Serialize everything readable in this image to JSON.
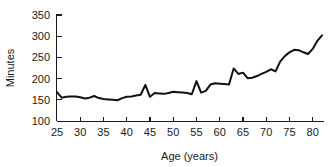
{
  "chart_data": {
    "type": "line",
    "title": "",
    "xlabel": "Age (years)",
    "ylabel": "Minutes",
    "xlim": [
      25,
      82
    ],
    "ylim": [
      100,
      350
    ],
    "grid": false,
    "legend": null,
    "xticks": [
      25,
      30,
      35,
      40,
      45,
      50,
      55,
      60,
      65,
      70,
      75,
      80
    ],
    "yticks": [
      100,
      150,
      200,
      250,
      300,
      350
    ],
    "xtick_labels": [
      "25",
      "30",
      "35",
      "40",
      "45",
      "50",
      "55",
      "60",
      "65",
      "70",
      "75",
      "80"
    ],
    "ytick_labels": [
      "100",
      "150",
      "200",
      "250",
      "300",
      "350"
    ],
    "line_color": "#111111",
    "axis_color": "#1a1a1a",
    "series": [
      {
        "name": "Minutes",
        "x": [
          25,
          26,
          27,
          28,
          29,
          30,
          31,
          32,
          33,
          34,
          35,
          36,
          37,
          38,
          39,
          40,
          41,
          42,
          43,
          44,
          45,
          46,
          47,
          48,
          49,
          50,
          51,
          52,
          53,
          54,
          55,
          56,
          57,
          58,
          59,
          60,
          61,
          62,
          63,
          64,
          65,
          66,
          67,
          68,
          69,
          70,
          71,
          72,
          73,
          74,
          75,
          76,
          77,
          78,
          79,
          80,
          81,
          82
        ],
        "values": [
          168,
          155,
          157,
          158,
          158,
          156,
          153,
          155,
          159,
          154,
          152,
          151,
          150,
          149,
          154,
          157,
          158,
          160,
          162,
          185,
          157,
          166,
          165,
          164,
          166,
          169,
          168,
          167,
          166,
          163,
          194,
          167,
          171,
          186,
          189,
          188,
          187,
          186,
          224,
          211,
          214,
          201,
          202,
          206,
          211,
          216,
          222,
          217,
          240,
          253,
          262,
          268,
          267,
          262,
          258,
          270,
          289,
          302
        ]
      }
    ]
  },
  "geometry": {
    "plot_left": 57,
    "plot_right": 322,
    "plot_top": 15,
    "plot_bottom": 121
  },
  "icons": {
    "axis_y": "y-axis-icon",
    "axis_x": "x-axis-icon"
  }
}
